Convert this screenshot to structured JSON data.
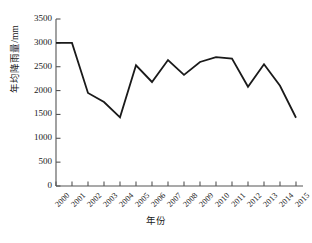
{
  "chart_data": {
    "type": "line",
    "title": "",
    "xlabel": "年份",
    "ylabel": "年均降雨量/mm",
    "categories": [
      "2000",
      "2001",
      "2002",
      "2003",
      "2004",
      "2005",
      "2006",
      "2007",
      "2008",
      "2009",
      "2010",
      "2011",
      "2012",
      "2013",
      "2014",
      "2015"
    ],
    "values": [
      3000,
      3000,
      1950,
      1760,
      1440,
      2530,
      2180,
      2640,
      2330,
      2600,
      2700,
      2670,
      2080,
      2550,
      2100,
      1430
    ],
    "series": [
      {
        "name": "年均降雨量",
        "values": [
          3000,
          3000,
          1950,
          1760,
          1440,
          2530,
          2180,
          2640,
          2330,
          2600,
          2700,
          2670,
          2080,
          2550,
          2100,
          1430
        ]
      }
    ],
    "ylim": [
      0,
      3500
    ],
    "yticks": [
      0,
      500,
      1000,
      1500,
      2000,
      2500,
      3000,
      3500
    ],
    "ytick_labels": [
      "0",
      "500",
      "1000",
      "1500",
      "2000",
      "2500",
      "3000",
      "3500"
    ],
    "xtick_labels": [
      "2000",
      "2001",
      "2002",
      "2003",
      "2004",
      "2005",
      "2006",
      "2007",
      "2008",
      "2009",
      "2010",
      "2011",
      "2012",
      "2013",
      "2014",
      "2015"
    ],
    "grid": false,
    "legend": false,
    "legend_position": "none",
    "line_color": "#1a1a1a",
    "axis_color": "#555555",
    "background_color": "#ffffff",
    "markers": false
  },
  "axes": {
    "y_axis_title": "年均降雨量/mm",
    "x_axis_title": "年份"
  }
}
